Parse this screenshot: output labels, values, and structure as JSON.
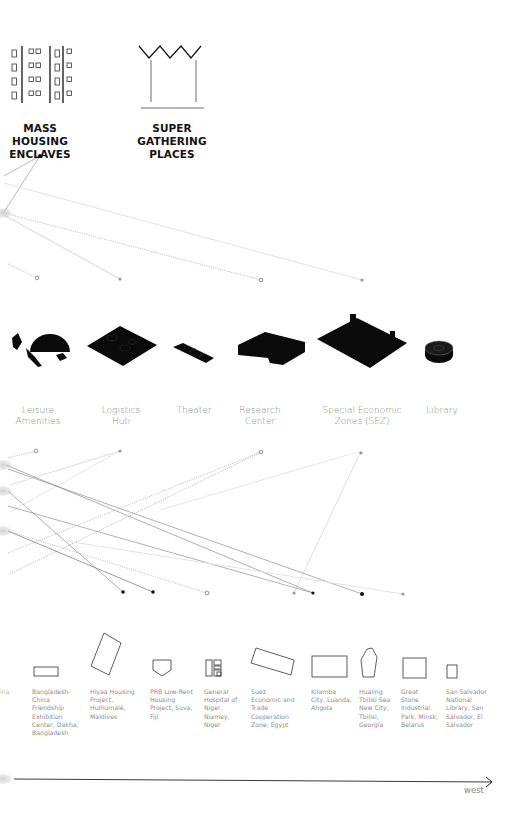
{
  "categories": [
    {
      "id": "mass-housing",
      "title_line1": "MASS HOUSING",
      "title_line2": "ENCLAVES",
      "icon": "housing-block-icon"
    },
    {
      "id": "super-gathering",
      "title_line1": "SUPER GATHERING",
      "title_line2": "PLACES",
      "icon": "gathering-crown-icon"
    }
  ],
  "building_types": [
    {
      "label_line1": "Leisure",
      "label_line2": "Amenities",
      "icon": "leisure-amenities-icon"
    },
    {
      "label_line1": "Logistics",
      "label_line2": "Hub",
      "icon": "logistics-hub-icon"
    },
    {
      "label_line1": "Theater",
      "label_line2": "",
      "icon": "theater-icon"
    },
    {
      "label_line1": "Research",
      "label_line2": "Center",
      "icon": "research-center-icon"
    },
    {
      "label_line1": "Special Economic",
      "label_line2": "Zones (SEZ)",
      "icon": "sez-icon"
    },
    {
      "label_line1": "Library",
      "label_line2": "",
      "icon": "library-icon"
    }
  ],
  "projects": [
    {
      "label": "ina",
      "icon": "none"
    },
    {
      "label": "Bangladesh-\nChina\nFriendship\nExhibition\nCenter, Dakha,\nBangladesh",
      "icon": "footprint-rectangle-flat-icon"
    },
    {
      "label": "Hiyaa Housing\nProject,\nHulhumalé,\nMaldives",
      "icon": "footprint-rotated-rectangle-icon"
    },
    {
      "label": "PRB Low-Rent\nHousing\nProject, Suva,\nFiji",
      "icon": "footprint-pentagon-icon"
    },
    {
      "label": "General\nHospital of\nNiger,\nNiamey,\nNiger",
      "icon": "footprint-hospital-icon"
    },
    {
      "label": "Suez\nEconomic and\nTrade\nCooperation\nZone, Egypt",
      "icon": "footprint-tilted-rectangle-icon"
    },
    {
      "label": "Kilamba\nCity, Luanda,\nAngola",
      "icon": "footprint-rectangle-icon"
    },
    {
      "label": "Hualing\nTbilisi Sea\nNew City,\nTbilisi,\nGeorgia",
      "icon": "footprint-polygon-icon"
    },
    {
      "label": "Great\nStone\nIndustrial\nPark, Minsk,\nBelarus",
      "icon": "footprint-square-icon"
    },
    {
      "label": "San Salvador\nNational\nLibrary, San\nSalvador, El\nSalvador",
      "icon": "footprint-small-square-icon"
    }
  ],
  "axis": {
    "label": "west",
    "direction": "right"
  },
  "colors": {
    "ink": "#111111",
    "line_dark": "#6e6e6e",
    "line_light": "#d9d9d9",
    "label_grey": "#8a8a8a"
  }
}
